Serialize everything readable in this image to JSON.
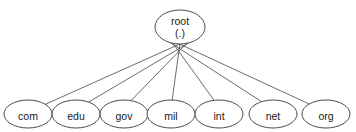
{
  "diagram": {
    "type": "tree",
    "background_color": "#ffffff",
    "node_fill_color": "#ffffff",
    "node_stroke_color": "#4d4d4d",
    "edge_color": "#5a5a5a",
    "text_color": "#1a1a1a",
    "root": {
      "label_line1": "root",
      "label_line2": "(.)",
      "cx": 180,
      "cy": 27,
      "rx": 25,
      "ry": 17
    },
    "children": [
      {
        "label": "com",
        "cx": 28,
        "cy": 114,
        "rx": 24,
        "ry": 14
      },
      {
        "label": "edu",
        "cx": 76,
        "cy": 114,
        "rx": 24,
        "ry": 14
      },
      {
        "label": "gov",
        "cx": 124,
        "cy": 114,
        "rx": 24,
        "ry": 14
      },
      {
        "label": "mil",
        "cx": 171,
        "cy": 114,
        "rx": 24,
        "ry": 14
      },
      {
        "label": "int",
        "cx": 219,
        "cy": 114,
        "rx": 24,
        "ry": 14
      },
      {
        "label": "net",
        "cx": 273,
        "cy": 114,
        "rx": 24,
        "ry": 14
      },
      {
        "label": "org",
        "cx": 326,
        "cy": 114,
        "rx": 24,
        "ry": 14
      }
    ],
    "edges": [
      {
        "from": "root",
        "to": "com"
      },
      {
        "from": "root",
        "to": "edu"
      },
      {
        "from": "root",
        "to": "gov"
      },
      {
        "from": "root",
        "to": "mil"
      },
      {
        "from": "root",
        "to": "int"
      },
      {
        "from": "root",
        "to": "net"
      },
      {
        "from": "root",
        "to": "org"
      }
    ]
  }
}
